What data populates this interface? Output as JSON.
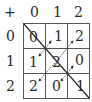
{
  "operator": "+",
  "col_headers": [
    "0",
    "1",
    "2"
  ],
  "row_headers": [
    "0",
    "1",
    "2"
  ],
  "cells": [
    [
      "0",
      "1",
      "2"
    ],
    [
      "1",
      "2",
      "0"
    ],
    [
      "2",
      "0",
      "1"
    ]
  ],
  "colors": {
    "ink": "#2a2a2a",
    "grid": "#555555",
    "background": "#ffffff"
  }
}
